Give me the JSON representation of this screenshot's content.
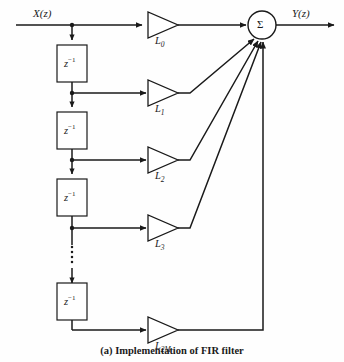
{
  "figure": {
    "caption": "(a)  Implementation of FIR filter",
    "background_color": "#fefefe",
    "line_color": "#1a1a1a"
  },
  "signals": {
    "input_label": "X(z)",
    "output_label": "Y(z)"
  },
  "summation_node": {
    "symbol": "Σ",
    "name": "summer"
  },
  "delay_label": "z",
  "delay_exponent": "−1",
  "delay_elements": [
    {
      "id": "delay-1",
      "label": "z",
      "exponent": "−1"
    },
    {
      "id": "delay-2",
      "label": "z",
      "exponent": "−1"
    },
    {
      "id": "delay-3",
      "label": "z",
      "exponent": "−1"
    },
    {
      "id": "delay-4",
      "label": "z",
      "exponent": "−1"
    }
  ],
  "gains": [
    {
      "id": "gain-0",
      "base": "L",
      "sub": "0"
    },
    {
      "id": "gain-1",
      "base": "L",
      "sub": "1"
    },
    {
      "id": "gain-2",
      "base": "L",
      "sub": "2"
    },
    {
      "id": "gain-3",
      "base": "L",
      "sub": "3"
    },
    {
      "id": "gain-2M",
      "base": "L",
      "sub": "2M"
    }
  ],
  "ellipsis": {
    "name": "vertical-ellipsis",
    "dot_count": 5
  }
}
